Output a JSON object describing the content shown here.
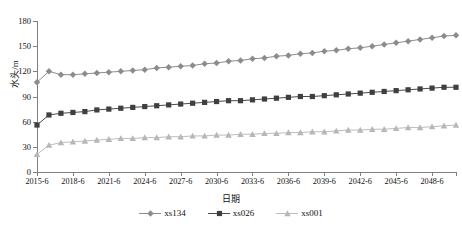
{
  "chart_data": {
    "type": "line",
    "title": "",
    "xlabel": "日期",
    "ylabel": "水头/m",
    "ylim": [
      0,
      180
    ],
    "yticks": [
      0,
      30,
      60,
      90,
      120,
      150,
      180
    ],
    "grid": false,
    "legend_position": "bottom",
    "x_tick_labels": [
      "2015-6",
      "2018-6",
      "2021-6",
      "2024-6",
      "2027-6",
      "2030-6",
      "2033-6",
      "2036-6",
      "2039-6",
      "2042-6",
      "2045-6",
      "2048-6"
    ],
    "x_tick_step_years": 3,
    "x_start_year": 2015,
    "x_end_year": 2050,
    "x": [
      "2015-6",
      "2016-6",
      "2017-6",
      "2018-6",
      "2019-6",
      "2020-6",
      "2021-6",
      "2022-6",
      "2023-6",
      "2024-6",
      "2025-6",
      "2026-6",
      "2027-6",
      "2028-6",
      "2029-6",
      "2030-6",
      "2031-6",
      "2032-6",
      "2033-6",
      "2034-6",
      "2035-6",
      "2036-6",
      "2037-6",
      "2038-6",
      "2039-6",
      "2040-6",
      "2041-6",
      "2042-6",
      "2043-6",
      "2044-6",
      "2045-6",
      "2046-6",
      "2047-6",
      "2048-6",
      "2049-6",
      "2050-6"
    ],
    "series": [
      {
        "name": "xs134",
        "marker": "diamond",
        "color": "#8c8c8c",
        "line_color": "#8c8c8c",
        "values": [
          107,
          120,
          116,
          116,
          117,
          118,
          119,
          120,
          121,
          122,
          124,
          125,
          126,
          127,
          129,
          130,
          132,
          133,
          135,
          136,
          138,
          139,
          141,
          142,
          144,
          145,
          147,
          148,
          150,
          152,
          154,
          156,
          158,
          160,
          162,
          163
        ]
      },
      {
        "name": "xs026",
        "marker": "square",
        "color": "#3f3f3f",
        "line_color": "#4a4a4a",
        "values": [
          56,
          68,
          70,
          71,
          72,
          74,
          75,
          76,
          77,
          78,
          79,
          80,
          81,
          82,
          83,
          84,
          85,
          85,
          86,
          87,
          88,
          89,
          90,
          90,
          91,
          92,
          93,
          94,
          95,
          96,
          97,
          98,
          99,
          100,
          101,
          101
        ]
      },
      {
        "name": "xs001",
        "marker": "triangle",
        "color": "#b7b7b7",
        "line_color": "#bdbdbd",
        "values": [
          21,
          32,
          35,
          36,
          37,
          38,
          39,
          40,
          40,
          41,
          41,
          42,
          42,
          43,
          43,
          44,
          44,
          45,
          45,
          46,
          46,
          47,
          47,
          48,
          48,
          49,
          50,
          50,
          51,
          51,
          52,
          53,
          53,
          54,
          55,
          56
        ]
      }
    ]
  },
  "legend": {
    "entries": [
      {
        "label": "xs134"
      },
      {
        "label": "xs026"
      },
      {
        "label": "xs001"
      }
    ]
  }
}
